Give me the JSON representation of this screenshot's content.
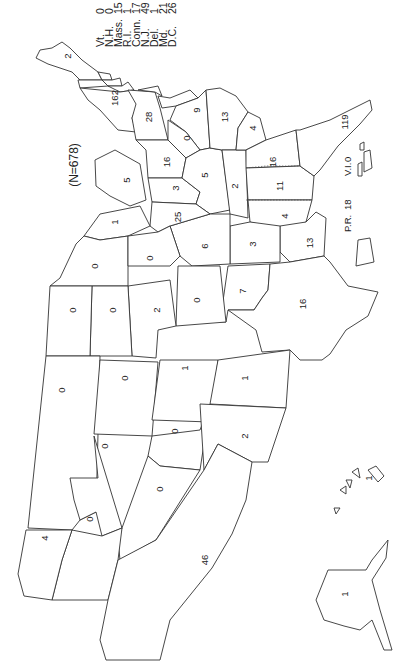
{
  "title": "(N=678)",
  "orientation": "rotated 90° counter-clockwise (north points left)",
  "legend": [
    {
      "state": "Vt.",
      "value": "0"
    },
    {
      "state": "N.H.",
      "value": "0"
    },
    {
      "state": "Mass.",
      "value": "15"
    },
    {
      "state": "R.I.",
      "value": "1"
    },
    {
      "state": "Conn.",
      "value": "17"
    },
    {
      "state": "N.J.",
      "value": "49"
    },
    {
      "state": "Del.",
      "value": "1"
    },
    {
      "state": "Md.",
      "value": "21"
    },
    {
      "state": "D.C.",
      "value": "26"
    }
  ],
  "states": {
    "maine": "2",
    "new_york": "162",
    "pennsylvania": "28",
    "virginia": "9",
    "west_virginia": "0",
    "ohio": "16",
    "michigan": "5",
    "indiana": "3",
    "kentucky": "5",
    "north_carolina": "13",
    "tennessee": "2",
    "south_carolina": "4",
    "georgia": "16",
    "alabama": "11",
    "mississippi": "4",
    "florida": "119",
    "louisiana": "13",
    "arkansas": "3",
    "missouri": "6",
    "illinois": "25",
    "wisconsin": "1",
    "minnesota": "0",
    "iowa": "0",
    "oklahoma": "7",
    "texas": "16",
    "kansas": "0",
    "nebraska": "2",
    "south_dakota": "0",
    "north_dakota": "0",
    "montana": "0",
    "wyoming": "0",
    "colorado": "1",
    "new_mexico": "1",
    "idaho": "0",
    "utah": "0",
    "arizona": "2",
    "nevada": "0",
    "oregon": "0",
    "washington": "4",
    "california": "46",
    "hawaii": "1",
    "alaska": "1"
  },
  "territories": {
    "pr_label": "P.R.",
    "pr_value": "18",
    "vi_label": "V.I.",
    "vi_value": "0"
  }
}
